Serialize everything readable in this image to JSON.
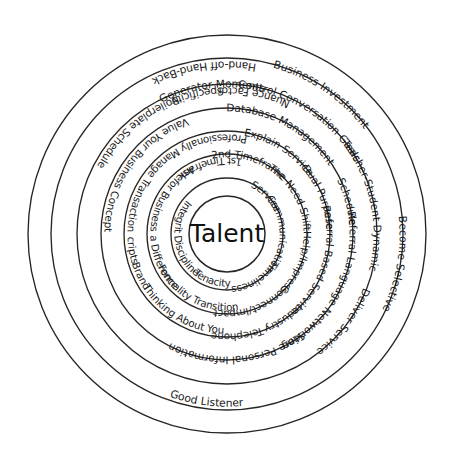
{
  "diagram": {
    "title": "Talent",
    "center_label": "Talent",
    "type": "concentric-ring-word-diagram",
    "colors": {
      "stroke": "#262626",
      "text": "#1a1a1a",
      "background": "#ffffff"
    },
    "geometry": {
      "center_x": 227,
      "center_y": 234,
      "center_radius": 38,
      "ring_radii": [
        56,
        80,
        103,
        126,
        150,
        176,
        199
      ]
    },
    "rings": [
      {
        "index": 1,
        "name": "core-attributes",
        "radius": 56,
        "labels": [
          {
            "text": "Service",
            "angle": -44,
            "flip": false
          },
          {
            "text": "Communication",
            "angle": 0,
            "flip": false
          },
          {
            "text": "Timeliness",
            "angle": 57,
            "flip": false
          },
          {
            "text": "Tenacity",
            "angle": 108,
            "flip": true
          },
          {
            "text": "Discipline",
            "angle": 152,
            "flip": true
          },
          {
            "text": "Integrity",
            "angle": 198,
            "flip": true
          }
        ]
      },
      {
        "index": 2,
        "name": "engagement-moments",
        "radius": 80,
        "labels": [
          {
            "text": "The Need Shift",
            "angle": -30,
            "flip": false
          },
          {
            "text": "Help/Impress",
            "angle": 22,
            "flip": false
          },
          {
            "text": "Connect/Impact",
            "angle": 70,
            "flip": false
          },
          {
            "text": "Formality Transition",
            "angle": 118,
            "flip": true
          },
          {
            "text": "Make a Difference",
            "angle": 167,
            "flip": true
          },
          {
            "text": "Ask for Business",
            "angle": 213,
            "flip": true
          },
          {
            "text": "1st Timeframe",
            "angle": 255,
            "flip": true
          },
          {
            "text": "2nd Timeframe",
            "angle": -73,
            "flip": false
          }
        ]
      },
      {
        "index": 3,
        "name": "service-delivery",
        "radius": 103,
        "labels": [
          {
            "text": "Explain Service",
            "angle": -58,
            "flip": false
          },
          {
            "text": "Dual Purpose",
            "angle": -22,
            "flip": false
          },
          {
            "text": "Referral Based Service",
            "angle": 17,
            "flip": false
          },
          {
            "text": "Industry",
            "angle": 56,
            "flip": false
          },
          {
            "text": "Telephone",
            "angle": 84,
            "flip": false
          },
          {
            "text": "Thinking About You",
            "angle": 120,
            "flip": true
          },
          {
            "text": "Brand",
            "angle": 154,
            "flip": true
          },
          {
            "text": "Scripts",
            "angle": 172,
            "flip": true
          },
          {
            "text": "Professionally Manage Transaction",
            "angle": 232,
            "flip": true
          }
        ]
      },
      {
        "index": 4,
        "name": "systems-and-language",
        "radius": 126,
        "labels": [
          {
            "text": "Database Management",
            "angle": -62,
            "flip": false
          },
          {
            "text": "Schedule",
            "angle": -15,
            "flip": false
          },
          {
            "text": "Referral Language",
            "angle": 12,
            "flip": false
          },
          {
            "text": "Networking",
            "angle": 50,
            "flip": false
          },
          {
            "text": "Store Personal Information",
            "angle": 85,
            "flip": false
          },
          {
            "text": "Value Your Business Concept",
            "angle": 216,
            "flip": true
          }
        ]
      },
      {
        "index": 5,
        "name": "relationship-practices",
        "radius": 150,
        "labels": [
          {
            "text": "Control Conversation",
            "angle": -64,
            "flip": false
          },
          {
            "text": "Goals",
            "angle": -35,
            "flip": false
          },
          {
            "text": "Teacher-Student Dynamic",
            "angle": -12,
            "flip": false
          },
          {
            "text": "Deliver Service",
            "angle": 37,
            "flip": false
          },
          {
            "text": "Boilerplate Schedule",
            "angle": 229,
            "flip": true
          },
          {
            "text": "Specificity",
            "angle": 258,
            "flip": true
          },
          {
            "text": "Nuance Factor",
            "angle": 281,
            "flip": true
          },
          {
            "text": "Generator Moments",
            "angle": -96,
            "flip": false
          }
        ]
      },
      {
        "index": 6,
        "name": "outcomes",
        "radius": 176,
        "labels": [
          {
            "text": "Business Investment",
            "angle": -56,
            "flip": false
          },
          {
            "text": "Become Selective",
            "angle": 10,
            "flip": false
          },
          {
            "text": "Good Listener",
            "angle": 97,
            "flip": true
          },
          {
            "text": "Hand-off Hand-Back",
            "angle": 262,
            "flip": true
          }
        ]
      },
      {
        "index": 7,
        "name": "outer-boundary",
        "radius": 199,
        "labels": []
      }
    ]
  }
}
